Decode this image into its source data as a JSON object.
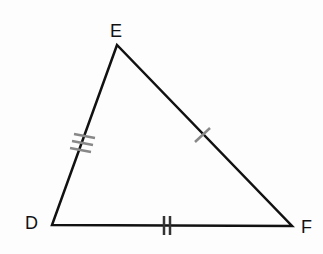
{
  "diagram": {
    "type": "triangle",
    "vertices": [
      {
        "label": "E",
        "x": 117,
        "y": 45
      },
      {
        "label": "D",
        "x": 52,
        "y": 225
      },
      {
        "label": "F",
        "x": 292,
        "y": 226
      }
    ],
    "sides": [
      {
        "name": "DE",
        "tick_marks": 3
      },
      {
        "name": "EF",
        "tick_marks": 1
      },
      {
        "name": "DF",
        "tick_marks": 2
      }
    ],
    "colors": {
      "line": "#111111",
      "tick": "#888888",
      "background": "#fdfdfd"
    }
  }
}
